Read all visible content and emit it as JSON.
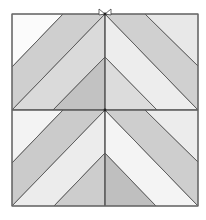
{
  "diagram": {
    "type": "quilt-block",
    "frame": {
      "x": 12,
      "y": 14,
      "width": 186,
      "height": 192
    },
    "colors": {
      "white": "#fbfbfb",
      "very_light": "#ececec",
      "light": "#e0e0e0",
      "mid": "#cdcdcd",
      "dark": "#bdbdbd",
      "stroke": "#555555"
    },
    "halves": [
      {
        "name": "top-half",
        "pieces": [
          {
            "name": "corner-left",
            "points": "12,14 63,14 12,67",
            "color": "#fbfbfb"
          },
          {
            "name": "band-left-outer",
            "points": "63,14 105,14 12,110 12,67",
            "color": "#cfcfcf"
          },
          {
            "name": "band-left-inner",
            "points": "105,14 105,57 53,110 12,110",
            "color": "#dadada"
          },
          {
            "name": "triangle-left-inner",
            "points": "105,57 105,110 53,110",
            "color": "#c2c2c2"
          },
          {
            "name": "triangle-right-inner",
            "points": "105,57 157,110 105,110",
            "color": "#dcdcdc"
          },
          {
            "name": "band-right-inner",
            "points": "105,14 198,110 157,110 105,57",
            "color": "#ededed"
          },
          {
            "name": "band-right-outer",
            "points": "105,14 145,14 198,66 198,110",
            "color": "#d0d0d0"
          },
          {
            "name": "corner-right",
            "points": "145,14 198,14 198,66",
            "color": "#e8e8e8"
          }
        ]
      },
      {
        "name": "bottom-half",
        "pieces": [
          {
            "name": "corner-left",
            "points": "12,110 63,110 12,163",
            "color": "#f3f3f3"
          },
          {
            "name": "band-left-outer",
            "points": "63,110 105,110 12,206 12,163",
            "color": "#cbcbcb"
          },
          {
            "name": "band-left-inner",
            "points": "105,110 105,153 54,206 12,206",
            "color": "#ececec"
          },
          {
            "name": "triangle-left-inner",
            "points": "105,153 105,206 54,206",
            "color": "#cdcdcd"
          },
          {
            "name": "triangle-right-inner",
            "points": "105,153 156,206 105,206",
            "color": "#bfbfbf"
          },
          {
            "name": "band-right-inner",
            "points": "105,110 198,206 156,206 105,153",
            "color": "#f4f4f4"
          },
          {
            "name": "band-right-outer",
            "points": "105,110 145,110 198,162 198,206",
            "color": "#cecece"
          },
          {
            "name": "corner-right",
            "points": "145,110 198,110 198,162",
            "color": "#ececec"
          }
        ]
      }
    ],
    "lines": [
      {
        "name": "center-vertical-line",
        "x1": 105,
        "y1": 14,
        "x2": 105,
        "y2": 206
      },
      {
        "name": "middle-horizontal-line",
        "x1": 12,
        "y1": 110,
        "x2": 198,
        "y2": 110
      }
    ],
    "marks": [
      {
        "name": "bowtie-mark-top",
        "left": "99,9 105,14 99,15",
        "right": "111,9 105,14 111,15"
      }
    ],
    "vertices": [
      {
        "name": "vertex-top-center",
        "x": 105,
        "y": 14
      },
      {
        "name": "vertex-middle-center",
        "x": 105,
        "y": 110
      }
    ]
  }
}
